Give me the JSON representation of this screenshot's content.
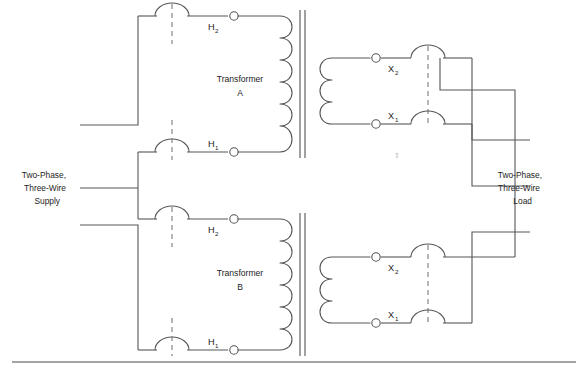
{
  "diagram": {
    "stroke_color": "#55565a",
    "text_color": "#1d1d1d",
    "rule_color": "#4a4b4f",
    "background": "#ffffff"
  },
  "labels": {
    "supply": {
      "line1": "Two-Phase,",
      "line2": "Three-Wire",
      "line3": "Supply"
    },
    "load": {
      "line1": "Two-Phase,",
      "line2": "Three-Wire",
      "line3": "Load"
    }
  },
  "transformers": [
    {
      "id": "transformer-a",
      "name_line1": "Transformer",
      "name_line2": "A",
      "primary_terminals": [
        {
          "id": "a-h2",
          "label": "H",
          "sub": "2"
        },
        {
          "id": "a-h1",
          "label": "H",
          "sub": "1"
        }
      ],
      "secondary_terminals": [
        {
          "id": "a-x2",
          "label": "X",
          "sub": "2"
        },
        {
          "id": "a-x1",
          "label": "X",
          "sub": "1"
        }
      ],
      "primary_coil_turns": 6,
      "secondary_coil_turns": 3
    },
    {
      "id": "transformer-b",
      "name_line1": "Transformer",
      "name_line2": "B",
      "primary_terminals": [
        {
          "id": "b-h2",
          "label": "H",
          "sub": "2"
        },
        {
          "id": "b-h1",
          "label": "H",
          "sub": "1"
        }
      ],
      "secondary_terminals": [
        {
          "id": "b-x2",
          "label": "X",
          "sub": "2"
        },
        {
          "id": "b-x1",
          "label": "X",
          "sub": "1"
        }
      ],
      "primary_coil_turns": 6,
      "secondary_coil_turns": 3
    }
  ]
}
